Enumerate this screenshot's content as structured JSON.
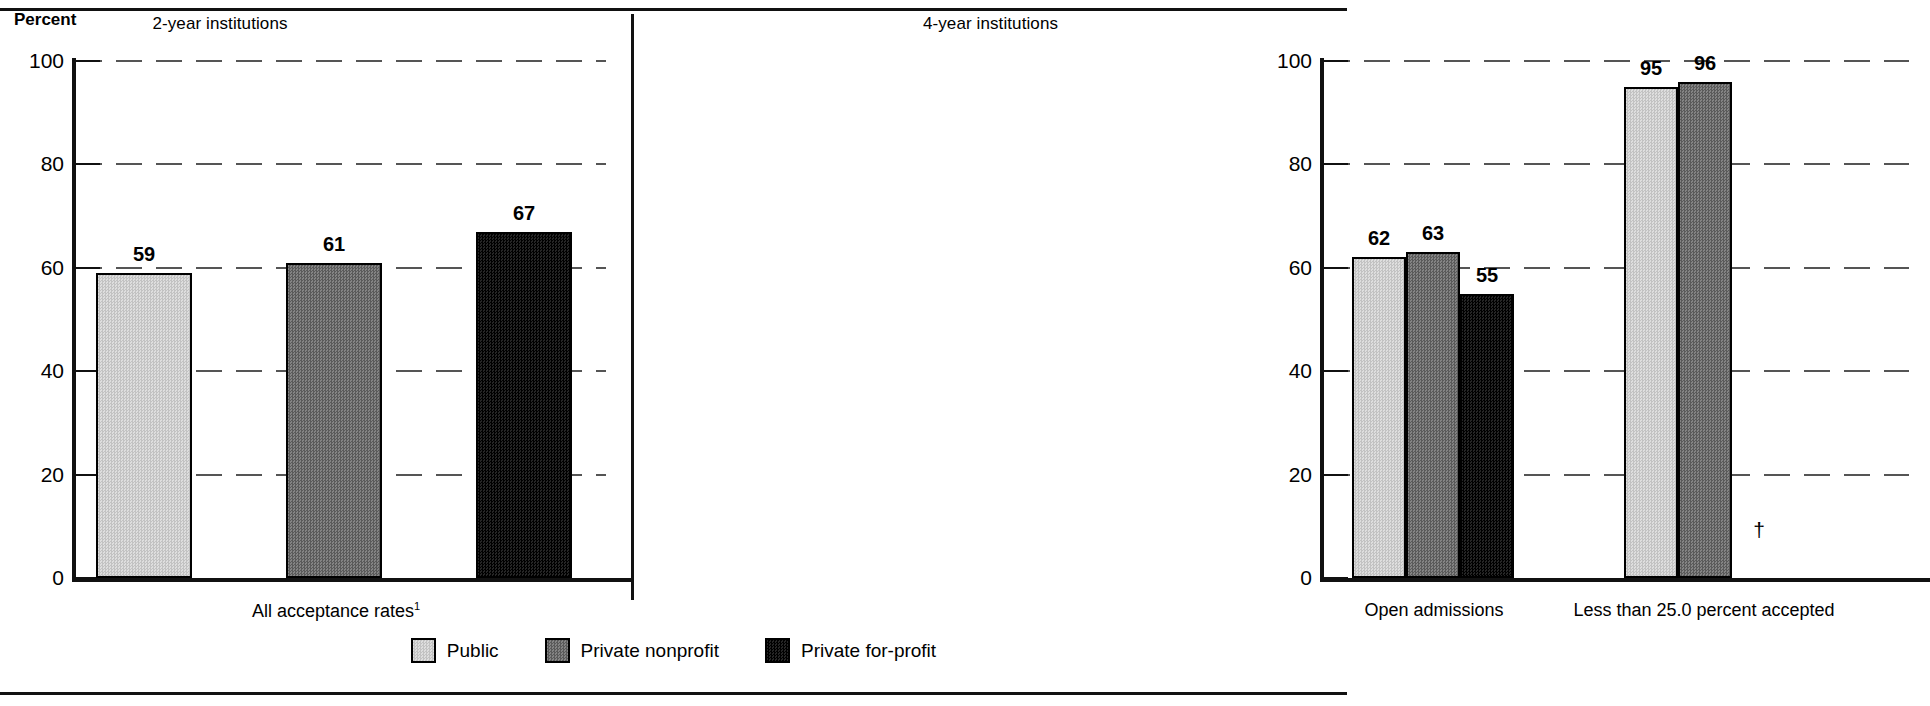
{
  "axis": {
    "y_title": "Percent",
    "ticks": [
      0,
      20,
      40,
      60,
      80,
      100
    ]
  },
  "panels": [
    {
      "id": "two-year",
      "title": "2-year institutions",
      "groups": [
        {
          "label": "All acceptance rates",
          "footnote": "1",
          "bars": [
            {
              "series": "Public",
              "value": 59,
              "display": "59",
              "fill": "fill-public"
            },
            {
              "series": "Private nonprofit",
              "value": 61,
              "display": "61",
              "fill": "fill-nonprofit"
            },
            {
              "series": "Private for-profit",
              "value": 67,
              "display": "67",
              "fill": "fill-forprofit"
            }
          ]
        }
      ]
    },
    {
      "id": "four-year",
      "title": "4-year institutions",
      "groups": [
        {
          "label": "Open admissions",
          "footnote": "",
          "bars": [
            {
              "series": "Public",
              "value": 62,
              "display": "62",
              "fill": "fill-public"
            },
            {
              "series": "Private nonprofit",
              "value": 63,
              "display": "63",
              "fill": "fill-nonprofit"
            },
            {
              "series": "Private for-profit",
              "value": 55,
              "display": "55",
              "fill": "fill-forprofit"
            }
          ]
        },
        {
          "label": "Less than 25.0 percent accepted",
          "footnote": "",
          "bars": [
            {
              "series": "Public",
              "value": 95,
              "display": "95",
              "fill": "fill-public"
            },
            {
              "series": "Private nonprofit",
              "value": 96,
              "display": "96",
              "fill": "fill-nonprofit"
            },
            {
              "series": "Private for-profit",
              "value": null,
              "display": "†",
              "fill": "fill-forprofit"
            }
          ]
        }
      ]
    }
  ],
  "legend": [
    {
      "label": "Public",
      "swatch": "fill-public",
      "color": "#d2d2d2"
    },
    {
      "label": "Private nonprofit",
      "swatch": "fill-nonprofit",
      "color": "#6f6f6f"
    },
    {
      "label": "Private for-profit",
      "swatch": "fill-forprofit",
      "color": "#141414"
    }
  ],
  "chart_data": {
    "type": "bar",
    "title": "",
    "xlabel": "",
    "ylabel": "Percent",
    "ylim": [
      0,
      100
    ],
    "yticks": [
      0,
      20,
      40,
      60,
      80,
      100
    ],
    "grid": true,
    "legend_position": "bottom-center",
    "panels": [
      "2-year institutions",
      "4-year institutions"
    ],
    "categories": [
      "All acceptance rates (2-year)",
      "Open admissions (4-year)",
      "Less than 25.0 percent accepted (4-year)"
    ],
    "series": [
      {
        "name": "Public",
        "values": [
          59,
          62,
          95
        ]
      },
      {
        "name": "Private nonprofit",
        "values": [
          61,
          63,
          96
        ]
      },
      {
        "name": "Private for-profit",
        "values": [
          67,
          55,
          null
        ]
      }
    ],
    "annotations": [
      "† reporting standards not met / not applicable for Private for-profit, Less than 25.0 percent accepted",
      "1 footnote marker on 'All acceptance rates'"
    ]
  }
}
